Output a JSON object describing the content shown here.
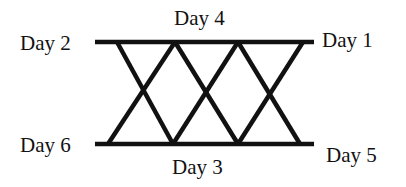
{
  "diagram": {
    "labels": {
      "top_left": "Day 2",
      "top_center": "Day 4",
      "top_right": "Day 1",
      "bottom_left": "Day 6",
      "bottom_center": "Day 3",
      "bottom_right": "Day 5"
    },
    "line_color": "#111111",
    "structure": {
      "horizontal_lines": 2,
      "diagonal_lines": 6,
      "crossings": 3
    }
  }
}
